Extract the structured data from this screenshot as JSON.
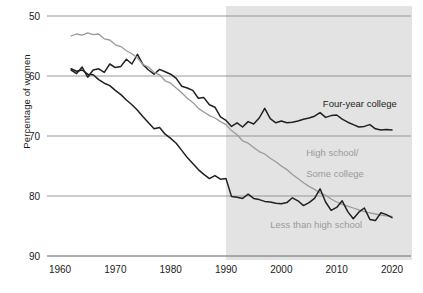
{
  "chart_data": {
    "type": "line",
    "title": "",
    "xlabel": "",
    "ylabel": "Percentage of women",
    "xlim": [
      1958,
      2021
    ],
    "ylim": [
      45,
      92
    ],
    "xticks": [
      1960,
      1970,
      1980,
      1990,
      2000,
      2010,
      2020
    ],
    "yticks": [
      50,
      60,
      70,
      80,
      90
    ],
    "grid": "horizontal",
    "legend_position": "inline-annotations",
    "shaded_region": {
      "label": "",
      "x_start": 1990,
      "x_end": 2021,
      "color": "#e3e3e3"
    },
    "series": [
      {
        "name": "Four-year college",
        "color": "#231f20",
        "label_x": 2009,
        "label_y": 73.6,
        "x": [
          1962,
          1963,
          1964,
          1965,
          1966,
          1967,
          1968,
          1969,
          1970,
          1971,
          1972,
          1973,
          1974,
          1975,
          1976,
          1977,
          1978,
          1979,
          1980,
          1981,
          1982,
          1983,
          1984,
          1985,
          1986,
          1987,
          1988,
          1989,
          1990,
          1991,
          1992,
          1993,
          1994,
          1995,
          1996,
          1997,
          1998,
          1999,
          2000,
          2001,
          2002,
          2003,
          2004,
          2005,
          2006,
          2007,
          2008,
          2009,
          2010,
          2011,
          2012,
          2013,
          2014,
          2015,
          2016,
          2017,
          2018,
          2019,
          2020
        ],
        "y": [
          81.0,
          80.4,
          81.5,
          79.8,
          81.0,
          81.2,
          80.6,
          82.0,
          81.4,
          81.6,
          82.8,
          82.0,
          83.6,
          81.9,
          81.0,
          80.3,
          81.1,
          80.7,
          80.3,
          79.6,
          78.3,
          78.0,
          77.6,
          76.3,
          76.4,
          75.2,
          74.8,
          73.2,
          72.6,
          71.6,
          72.2,
          71.5,
          72.4,
          72.0,
          73.0,
          74.6,
          72.9,
          72.2,
          72.5,
          72.2,
          72.3,
          72.5,
          72.8,
          73.0,
          73.3,
          73.9,
          73.1,
          73.4,
          73.5,
          72.8,
          72.3,
          71.9,
          71.5,
          71.6,
          71.9,
          71.2,
          71.0,
          71.1,
          71.0
        ]
      },
      {
        "name": "High school/Some college",
        "color": "#9a9a9a",
        "label_x": 2006,
        "label_y": 65.5,
        "x": [
          1962,
          1963,
          1964,
          1965,
          1966,
          1967,
          1968,
          1969,
          1970,
          1971,
          1972,
          1973,
          1974,
          1975,
          1976,
          1977,
          1978,
          1979,
          1980,
          1981,
          1982,
          1983,
          1984,
          1985,
          1986,
          1987,
          1988,
          1989,
          1990,
          1991,
          1992,
          1993,
          1994,
          1995,
          1996,
          1997,
          1998,
          1999,
          2000,
          2001,
          2002,
          2003,
          2004,
          2005,
          2006,
          2007,
          2008,
          2009,
          2010,
          2011,
          2012,
          2013,
          2014,
          2015,
          2016,
          2017,
          2018,
          2019,
          2020
        ],
        "y": [
          86.7,
          87.0,
          86.8,
          87.2,
          86.9,
          87.0,
          86.2,
          86.0,
          85.2,
          84.9,
          84.2,
          83.7,
          83.0,
          81.9,
          81.5,
          80.6,
          80.2,
          79.2,
          78.8,
          78.0,
          77.2,
          76.3,
          75.6,
          74.6,
          74.0,
          73.4,
          73.0,
          72.4,
          71.9,
          70.9,
          70.2,
          69.2,
          68.8,
          68.1,
          67.4,
          67.0,
          66.3,
          65.7,
          65.0,
          64.4,
          63.6,
          62.9,
          62.2,
          61.6,
          61.1,
          60.5,
          60.1,
          59.5,
          59.0,
          58.6,
          58.3,
          58.0,
          57.7,
          57.4,
          57.2,
          57.0,
          56.8,
          56.7,
          56.6
        ]
      },
      {
        "name": "Less than high school",
        "color": "#231f20",
        "label_x": 2001,
        "label_y": 54.2,
        "x": [
          1962,
          1963,
          1964,
          1965,
          1966,
          1967,
          1968,
          1969,
          1970,
          1971,
          1972,
          1973,
          1974,
          1975,
          1976,
          1977,
          1978,
          1979,
          1980,
          1981,
          1982,
          1983,
          1984,
          1985,
          1986,
          1987,
          1988,
          1989,
          1990,
          1991,
          1992,
          1993,
          1994,
          1995,
          1996,
          1997,
          1998,
          1999,
          2000,
          2001,
          2002,
          2003,
          2004,
          2005,
          2006,
          2007,
          2008,
          2009,
          2010,
          2011,
          2012,
          2013,
          2014,
          2015,
          2016,
          2017,
          2018,
          2019,
          2020
        ],
        "y": [
          81.2,
          80.8,
          81.0,
          80.3,
          80.2,
          79.4,
          78.8,
          78.4,
          77.6,
          76.9,
          76.0,
          75.2,
          74.3,
          73.2,
          72.2,
          71.2,
          71.4,
          70.3,
          69.6,
          68.8,
          67.6,
          66.4,
          65.4,
          64.4,
          63.6,
          62.9,
          63.4,
          62.8,
          62.9,
          59.9,
          59.8,
          59.6,
          60.3,
          59.6,
          59.4,
          59.1,
          59.0,
          58.8,
          58.7,
          58.9,
          59.7,
          59.2,
          58.4,
          58.9,
          59.6,
          61.2,
          59.0,
          57.6,
          58.1,
          59.2,
          57.4,
          56.2,
          57.3,
          58.0,
          56.1,
          55.9,
          57.2,
          56.9,
          56.4
        ]
      }
    ]
  },
  "axis": {
    "y_title": "Percentage of women",
    "yticks": [
      "90",
      "80",
      "70",
      "60",
      "50"
    ],
    "xticks": [
      "1960",
      "1970",
      "1980",
      "1990",
      "2000",
      "2010",
      "2020"
    ]
  },
  "annotations": [
    {
      "name": "four-year-college",
      "text": "Four-year college",
      "color": "#231f20"
    },
    {
      "name": "high-school-line1",
      "text": "High school/",
      "color": "#9a9a9a"
    },
    {
      "name": "high-school-line2",
      "text": "Some college",
      "color": "#9a9a9a"
    },
    {
      "name": "less-than-high-school",
      "text": "Less than high school",
      "color": "#9a9a9a"
    }
  ],
  "colors": {
    "dark_line": "#231f20",
    "gray_line": "#9a9a9a",
    "grid": "#8d8d8d",
    "shade": "#e3e3e3",
    "text": "#1a1a1a"
  }
}
